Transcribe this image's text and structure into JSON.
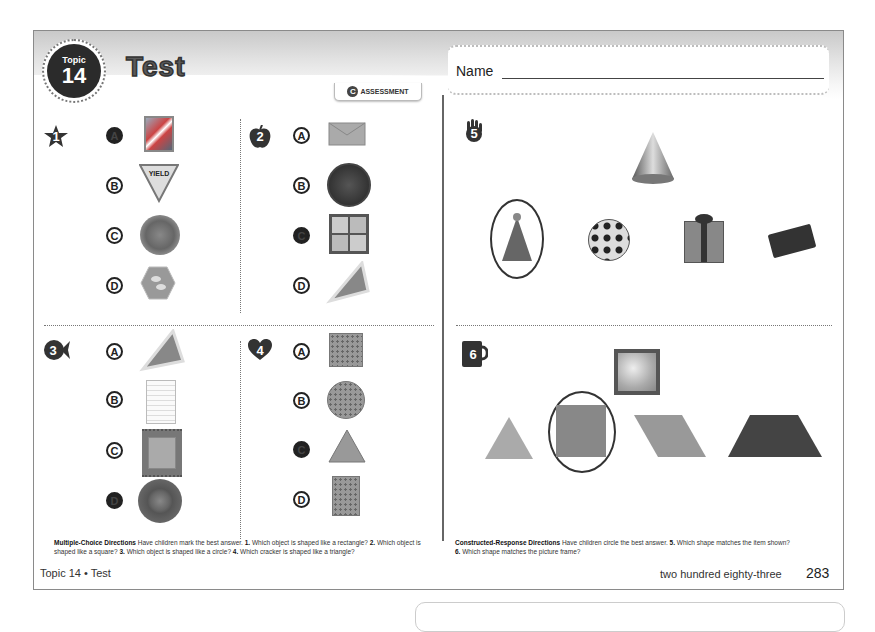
{
  "header": {
    "topic_label": "Topic",
    "topic_number": "14",
    "title": "Test",
    "assessment_tag": "ASSESSMENT",
    "assessment_icon": "c-circle-icon",
    "name_label": "Name"
  },
  "questions": [
    {
      "number": "1",
      "number_icon": "star-icon",
      "options": [
        {
          "letter": "A",
          "filled": true,
          "picture": "postage-stamp-flag"
        },
        {
          "letter": "B",
          "filled": false,
          "picture": "yield-sign",
          "picture_text": "YIELD"
        },
        {
          "letter": "C",
          "filled": false,
          "picture": "round-plate"
        },
        {
          "letter": "D",
          "filled": false,
          "picture": "hexagon-tile"
        }
      ]
    },
    {
      "number": "2",
      "number_icon": "apple-icon",
      "options": [
        {
          "letter": "A",
          "filled": false,
          "picture": "envelope"
        },
        {
          "letter": "B",
          "filled": false,
          "picture": "penny-coin"
        },
        {
          "letter": "C",
          "filled": true,
          "picture": "square-window"
        },
        {
          "letter": "D",
          "filled": false,
          "picture": "pizza-slice"
        }
      ]
    },
    {
      "number": "3",
      "number_icon": "fish-icon",
      "options": [
        {
          "letter": "A",
          "filled": false,
          "picture": "pizza-slice"
        },
        {
          "letter": "B",
          "filled": false,
          "picture": "notepaper"
        },
        {
          "letter": "C",
          "filled": false,
          "picture": "square-rug"
        },
        {
          "letter": "D",
          "filled": true,
          "picture": "round-speaker"
        }
      ]
    },
    {
      "number": "4",
      "number_icon": "heart-icon",
      "options": [
        {
          "letter": "A",
          "filled": false,
          "picture": "square-cracker"
        },
        {
          "letter": "B",
          "filled": false,
          "picture": "round-cracker"
        },
        {
          "letter": "C",
          "filled": true,
          "picture": "triangle-cracker"
        },
        {
          "letter": "D",
          "filled": false,
          "picture": "rectangle-cracker"
        }
      ]
    },
    {
      "number": "5",
      "number_icon": "hand-icon",
      "target": "cone",
      "choices": [
        "party-hat",
        "soccer-ball",
        "gift-box",
        "brick"
      ],
      "circled_index": 0
    },
    {
      "number": "6",
      "number_icon": "mug-icon",
      "target": "picture-frame",
      "choices": [
        "triangle",
        "square",
        "parallelogram",
        "trapezoid"
      ],
      "circled_index": 1
    }
  ],
  "directions": {
    "left_heading": "Multiple-Choice Directions",
    "left_text": " Have children mark the best answer. ",
    "left_q1_num": "1.",
    "left_q1": " Which object is shaped like a rectangle? ",
    "left_q2_num": "2.",
    "left_q2": " Which object is shaped like a square? ",
    "left_q3_num": "3.",
    "left_q3": " Which object is shaped like a circle? ",
    "left_q4_num": "4.",
    "left_q4": " Which cracker is shaped like a triangle?",
    "right_heading": "Constructed-Response Directions",
    "right_text": " Have children circle the best answer. ",
    "right_q5_num": "5.",
    "right_q5": " Which shape matches the item shown?",
    "right_q6_num": "6.",
    "right_q6": " Which shape matches the picture frame?"
  },
  "footer": {
    "left": "Topic 14 • Test",
    "page_words": "two hundred eighty-three",
    "page_number": "283"
  }
}
